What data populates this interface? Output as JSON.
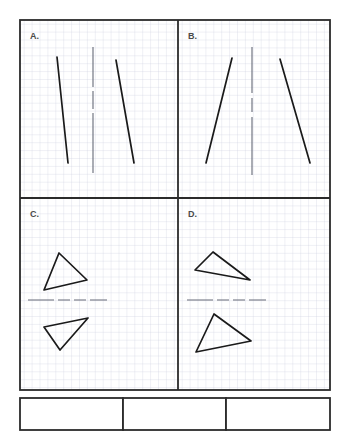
{
  "worksheet": {
    "title": "Reflection identification worksheet",
    "background_color": "#ffffff",
    "grid_color": "#c9cedd",
    "grid_cell_px": 7.9,
    "frame_color": "#2b2b2b",
    "ink_color": "#1a1a1a",
    "label_color": "#4a4a4a",
    "frame": {
      "x": 20,
      "y": 20,
      "width": 310,
      "height": 370
    },
    "divider_vertical_x": 178,
    "divider_horizontal_y": 198
  },
  "panels": [
    {
      "id": "panel-a",
      "label": "A.",
      "label_x": 30,
      "label_y": 39,
      "figure_type": "line-segments",
      "is_reflection": false,
      "mirror_line": {
        "orientation": "vertical",
        "style": "dashed",
        "x1": 93,
        "y1": 47,
        "x2": 93,
        "y2": 175
      },
      "shapes": [
        {
          "name": "segment-left",
          "points": "57,57 68,163"
        },
        {
          "name": "segment-right",
          "points": "116,60 134,163"
        }
      ]
    },
    {
      "id": "panel-b",
      "label": "B.",
      "label_x": 188,
      "label_y": 39,
      "figure_type": "line-segments",
      "is_reflection": true,
      "mirror_line": {
        "orientation": "vertical",
        "style": "dashed",
        "x1": 252,
        "y1": 47,
        "x2": 252,
        "y2": 175
      },
      "shapes": [
        {
          "name": "segment-left",
          "points": "232,58 206,163"
        },
        {
          "name": "segment-right",
          "points": "280,59 310,163"
        }
      ]
    },
    {
      "id": "panel-c",
      "label": "C.",
      "label_x": 30,
      "label_y": 217,
      "figure_type": "triangles",
      "is_reflection": true,
      "mirror_line": {
        "orientation": "horizontal",
        "style": "dashed",
        "x1": 28,
        "y1": 300,
        "x2": 107,
        "y2": 300
      },
      "shapes": [
        {
          "name": "triangle-upper",
          "points": "59,253 87,280 44,290"
        },
        {
          "name": "triangle-lower",
          "points": "88,318 44,327 60,350"
        }
      ]
    },
    {
      "id": "panel-d",
      "label": "D.",
      "label_x": 188,
      "label_y": 217,
      "figure_type": "triangles",
      "is_reflection": false,
      "mirror_line": {
        "orientation": "horizontal",
        "style": "dashed",
        "x1": 187,
        "y1": 300,
        "x2": 266,
        "y2": 300
      },
      "shapes": [
        {
          "name": "triangle-upper",
          "points": "213,252 250,280 195,270"
        },
        {
          "name": "triangle-lower",
          "points": "214,314 251,341 196,352"
        }
      ]
    }
  ],
  "answer_boxes": [
    {
      "id": "answer-box-1",
      "value": "",
      "x": 20,
      "y": 398,
      "width": 103,
      "height": 32
    },
    {
      "id": "answer-box-2",
      "value": "",
      "x": 123,
      "y": 398,
      "width": 103,
      "height": 32
    },
    {
      "id": "answer-box-3",
      "value": "",
      "x": 226,
      "y": 398,
      "width": 104,
      "height": 32
    }
  ]
}
